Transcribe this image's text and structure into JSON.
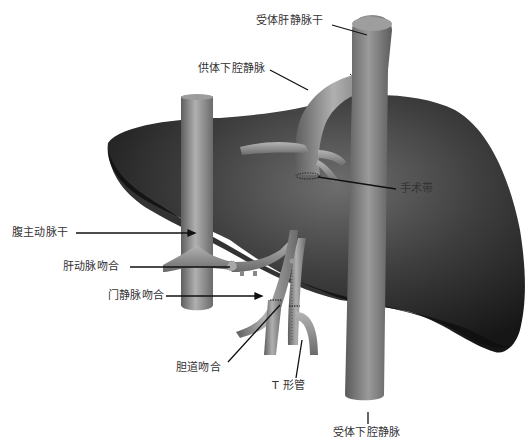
{
  "diagram": {
    "colors": {
      "background": "#ffffff",
      "liver_dark": "#1a1a1a",
      "liver_mid": "#4a4a4a",
      "liver_highlight": "#6e6e6e",
      "vessel": "#8a8a8a",
      "vessel_highlight": "#b8b8b8",
      "vessel_shadow": "#5a5a5a",
      "leader_line": "#111111",
      "label_text": "#333333"
    },
    "labels": {
      "recipient_hepatic_vein_trunk": "受体肝静脉干",
      "donor_ivc": "供体下腔静脉",
      "surgical_band": "手术带",
      "celiac_trunk": "腹主动脉干",
      "hepatic_artery_anastomosis": "肝动脉吻合",
      "portal_vein_anastomosis": "门静脉吻合",
      "bile_duct_anastomosis": "胆道吻合",
      "t_tube": "T 形管",
      "recipient_ivc": "受体下腔静脉"
    }
  }
}
